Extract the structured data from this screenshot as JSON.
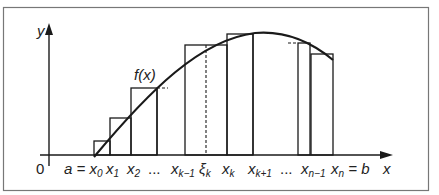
{
  "diagram": {
    "axes": {
      "x_label": "x",
      "y_label": "y",
      "origin_label": "0"
    },
    "curve_label": "f(x)",
    "tick_labels": [
      {
        "id": "a",
        "main": "a = x",
        "sub": "0"
      },
      {
        "id": "x1",
        "main": "x",
        "sub": "1"
      },
      {
        "id": "x2",
        "main": "x",
        "sub": "2"
      },
      {
        "id": "dots1",
        "main": "...",
        "sub": ""
      },
      {
        "id": "xk-1",
        "main": "x",
        "sub": "k−1"
      },
      {
        "id": "xi",
        "main": "ξ",
        "sub": "k"
      },
      {
        "id": "xk",
        "main": "x",
        "sub": "k"
      },
      {
        "id": "xk+1",
        "main": "x",
        "sub": "k+1"
      },
      {
        "id": "dots2",
        "main": "...",
        "sub": ""
      },
      {
        "id": "xn-1",
        "main": "x",
        "sub": "n−1"
      },
      {
        "id": "b",
        "main": "x",
        "sub": "n",
        "suffix": " = b"
      }
    ],
    "colors": {
      "stroke": "#1a1a1a",
      "frame": "#777777",
      "background": "#ffffff"
    }
  }
}
